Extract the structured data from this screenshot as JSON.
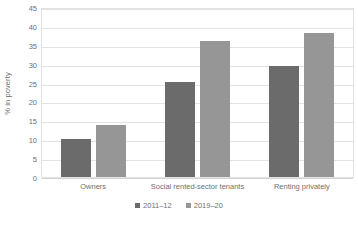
{
  "chart_data": {
    "type": "bar",
    "title": "",
    "subtitle": "",
    "xlabel": "",
    "ylabel": "% in poverty",
    "ylim": [
      0,
      45
    ],
    "ytick_step": 5,
    "yticks": [
      0,
      5,
      10,
      15,
      20,
      25,
      30,
      35,
      40,
      45
    ],
    "ytick_labels": [
      "0",
      "5",
      "10",
      "15",
      "20",
      "25",
      "30",
      "35",
      "40",
      "45"
    ],
    "grid": "horizontal",
    "legend_position": "bottom-center",
    "categories": [
      "Owners",
      "Social rented-sector tenants",
      "Renting privately"
    ],
    "series": [
      {
        "name": "2011–12",
        "color": "#6b6b6b",
        "values": [
          10.0,
          25.2,
          29.3
        ]
      },
      {
        "name": "2019–20",
        "color": "#969696",
        "values": [
          13.9,
          36.1,
          38.0
        ]
      }
    ],
    "annotations": []
  },
  "colors": {
    "series_1": "#6b6b6b",
    "series_2": "#969696",
    "gridline": "#e2e2e2",
    "plot_border": "#e2e2e2",
    "axis_text": "#6f6f6f",
    "background": "#ffffff"
  }
}
